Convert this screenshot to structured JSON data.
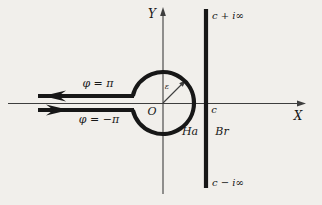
{
  "colors": {
    "background": "#f1efeb",
    "ink": "#171717",
    "axis": "#3e3e3e"
  },
  "labels": {
    "y_axis": "Y",
    "x_axis": "X",
    "origin": "O",
    "phi_upper": "φ = π",
    "phi_lower": "φ = −π",
    "radius": "ε",
    "c_point": "c",
    "c_plus_inf": "c + i∞",
    "c_minus_inf": "c − i∞",
    "hankel": "Ha",
    "bromwich": "Br"
  }
}
